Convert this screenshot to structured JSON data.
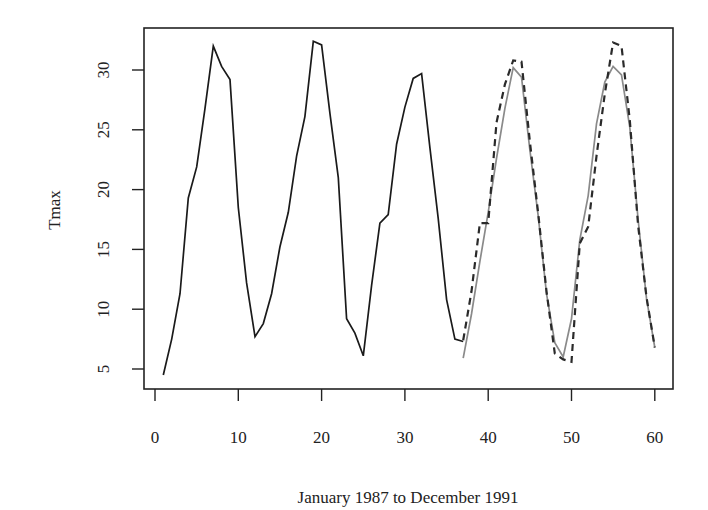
{
  "chart_data": {
    "type": "line",
    "title": "",
    "xlabel": "January 1987 to December 1991",
    "ylabel": "Tmax",
    "xlim": [
      0,
      61
    ],
    "ylim": [
      3.5,
      33.5
    ],
    "x_ticks": [
      0,
      10,
      20,
      30,
      40,
      50,
      60
    ],
    "y_ticks": [
      5,
      10,
      15,
      20,
      25,
      30
    ],
    "grid": false,
    "legend": null,
    "series": [
      {
        "name": "observed",
        "style": "solid",
        "color": "#1a1a1a",
        "x": [
          1,
          2,
          3,
          4,
          5,
          6,
          7,
          8,
          9,
          10,
          11,
          12,
          13,
          14,
          15,
          16,
          17,
          18,
          19,
          20,
          21,
          22,
          23,
          24,
          25,
          26,
          27,
          28,
          29,
          30,
          31,
          32,
          33,
          34,
          35,
          36,
          37
        ],
        "values": [
          4.5,
          7.5,
          11.3,
          19.3,
          21.9,
          26.8,
          32.0,
          30.3,
          29.2,
          18.5,
          12.2,
          7.7,
          8.8,
          11.3,
          15.2,
          18.1,
          22.8,
          26.1,
          32.4,
          32.1,
          26.4,
          21.0,
          9.2,
          8.0,
          6.1,
          12.0,
          17.2,
          17.9,
          23.8,
          26.9,
          29.3,
          29.7,
          23.5,
          17.6,
          10.8,
          7.5,
          7.3
        ]
      },
      {
        "name": "fitted",
        "style": "solid",
        "color": "#8a8a8a",
        "x": [
          37,
          38,
          39,
          40,
          41,
          42,
          43,
          44,
          45,
          46,
          47,
          48,
          49,
          50,
          51,
          52,
          53,
          54,
          55,
          56,
          57,
          58,
          59,
          60
        ],
        "values": [
          5.9,
          9.6,
          14.0,
          18.1,
          22.6,
          26.8,
          30.2,
          29.4,
          23.3,
          17.8,
          11.3,
          7.2,
          6.0,
          9.2,
          15.8,
          19.5,
          25.5,
          29.0,
          30.3,
          29.6,
          25.2,
          17.5,
          10.9,
          6.8
        ]
      },
      {
        "name": "forecast",
        "style": "dashed",
        "color": "#2a2a2a",
        "x": [
          37,
          38,
          39,
          40,
          41,
          42,
          43,
          44,
          45,
          46,
          47,
          48,
          49,
          50,
          51,
          52,
          53,
          54,
          55,
          56,
          57,
          58,
          59,
          60
        ],
        "values": [
          7.4,
          11.5,
          17.2,
          17.2,
          25.6,
          28.8,
          30.8,
          30.7,
          24.0,
          18.0,
          11.5,
          6.3,
          5.8,
          5.6,
          15.5,
          16.9,
          22.8,
          28.0,
          32.3,
          32.0,
          25.8,
          17.0,
          11.0,
          6.8
        ]
      }
    ]
  },
  "layout": {
    "plot_left": 144,
    "plot_right": 673,
    "plot_top": 28,
    "plot_bottom": 389,
    "x0_px": 155,
    "px_per_x": 8.33,
    "y30_px": 70,
    "px_per_y": 11.96
  },
  "labels": {
    "ylabel": "Tmax",
    "xlabel": "January 1987 to December 1991"
  }
}
